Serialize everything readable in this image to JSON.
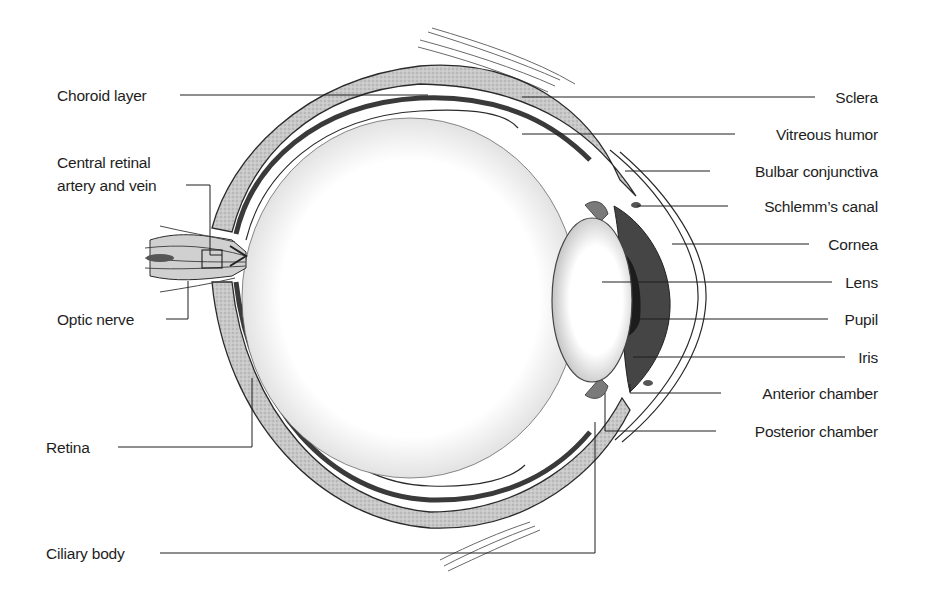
{
  "diagram": {
    "type": "anatomical-labeled-illustration",
    "style": {
      "line_color": "#1e1e1e",
      "tissue_shade": "#b8b8b8",
      "dark_band": "#3a3a3a",
      "background": "#ffffff"
    },
    "labels_left": [
      {
        "id": "choroid-layer",
        "text": "Choroid layer"
      },
      {
        "id": "central-retinal-artery-and-vein",
        "line1": "Central retinal",
        "line2": "artery and vein"
      },
      {
        "id": "optic-nerve",
        "text": "Optic nerve"
      },
      {
        "id": "retina",
        "text": "Retina"
      },
      {
        "id": "ciliary-body",
        "text": "Ciliary body"
      }
    ],
    "labels_right": [
      {
        "id": "sclera",
        "text": "Sclera"
      },
      {
        "id": "vitreous-humor",
        "text": "Vitreous humor"
      },
      {
        "id": "bulbar-conjunctiva",
        "text": "Bulbar conjunctiva"
      },
      {
        "id": "schlemms-canal",
        "text": "Schlemm’s canal"
      },
      {
        "id": "cornea",
        "text": "Cornea"
      },
      {
        "id": "lens",
        "text": "Lens"
      },
      {
        "id": "pupil",
        "text": "Pupil"
      },
      {
        "id": "iris",
        "text": "Iris"
      },
      {
        "id": "anterior-chamber",
        "text": "Anterior chamber"
      },
      {
        "id": "posterior-chamber",
        "text": "Posterior chamber"
      }
    ]
  }
}
